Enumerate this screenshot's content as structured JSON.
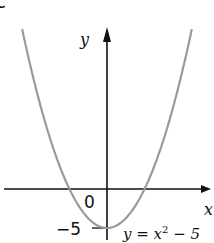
{
  "part_label": "c",
  "chart_data": {
    "type": "line",
    "title": "",
    "xlabel": "x",
    "ylabel": "y",
    "series": [
      {
        "name": "y = x^2 - 5",
        "equation": "y = x^2 - 5",
        "color": "#9a9a9a"
      }
    ],
    "annotations": {
      "origin": "0",
      "y_intercept": "−5",
      "equation_label": "y = x² − 5"
    },
    "key_points": [
      {
        "x": 0,
        "y": -5,
        "label": "vertex / y-intercept"
      },
      {
        "x": -2.236,
        "y": 0,
        "label": "x-intercept"
      },
      {
        "x": 2.236,
        "y": 0,
        "label": "x-intercept"
      }
    ],
    "x_range": [
      -5.8,
      5.8
    ],
    "y_range": [
      -6.5,
      21
    ],
    "grid": false,
    "legend": "none",
    "axis_color": "#111111",
    "curve_color": "#9a9a9a"
  },
  "labels": {
    "y_axis": "y",
    "x_axis": "x",
    "origin": "0",
    "y_intercept": "−5",
    "equation_prefix": "y = x",
    "equation_power": "2",
    "equation_suffix": " − 5"
  }
}
